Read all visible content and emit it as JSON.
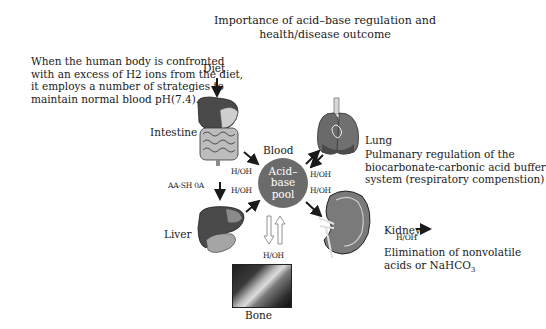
{
  "title": {
    "line1": "Importance of acid–base regulation and",
    "line2": "health/disease outcome"
  },
  "intro": {
    "line1": "When the human body is confronted",
    "line2": "with an excess of H2 ions from the diet,",
    "line3": "it employs a number of strategies to",
    "line4": "maintain normal blood pH(7.4)."
  },
  "nodes": {
    "diet": "Diet",
    "intestine": "Intestine",
    "liver": "Liver",
    "blood": "Blood",
    "pool": {
      "line1": "Acid–",
      "line2": "base",
      "line3": "pool"
    },
    "lung": "Lung",
    "kidney": "Kidney",
    "bone": "Bone"
  },
  "arrow_labels": {
    "intestine_liver": "AA-SH 0A",
    "intestine_blood": "H/OH",
    "liver_blood": "H/OH",
    "lung_blood": "H/OH",
    "blood_kidney": "H/OH",
    "kidney_out": "H/OH",
    "bone_blood": "H/OH"
  },
  "descriptions": {
    "lung": {
      "line1": "Pulmanary regulation of the",
      "line2": "biocarbonate-carbonic acid buffer",
      "line3": "system (respiratory compenstion)"
    },
    "kidney": {
      "line1": "Elimination of nonvolatile",
      "line2": "acids or NaHCO",
      "line2_sub": "3"
    }
  },
  "colors": {
    "pool": "#6b6b6b",
    "organ_dark": "#4a4a4a",
    "organ_mid": "#8a8a8a",
    "organ_light": "#d0d0d0",
    "arrow": "#1a1a1a"
  }
}
